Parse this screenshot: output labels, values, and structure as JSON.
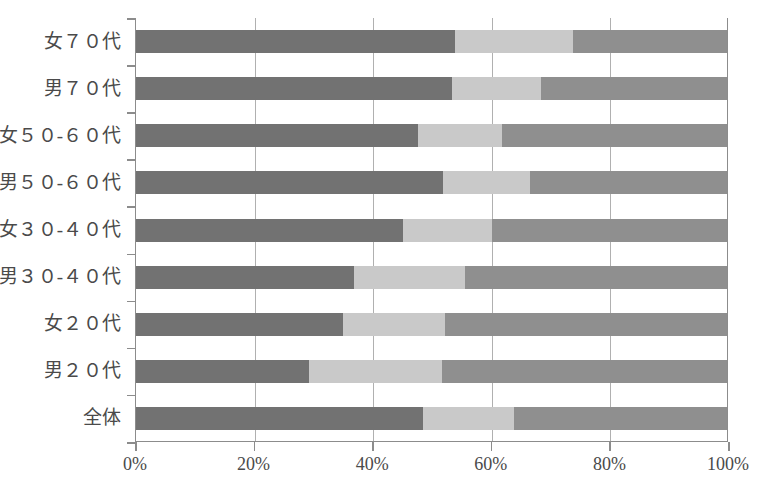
{
  "chart_data": {
    "type": "bar",
    "orientation": "horizontal",
    "stacked": true,
    "normalized": true,
    "title": "",
    "subtitle": "",
    "xlabel": "",
    "ylabel": "",
    "xlim": [
      0,
      100
    ],
    "grid": true,
    "legend": "none",
    "xticks": [
      0,
      20,
      40,
      60,
      80,
      100
    ],
    "xticklabels": [
      "0%",
      "20%",
      "40%",
      "60%",
      "80%",
      "100%"
    ],
    "categories": [
      "女７０代",
      "男７０代",
      "女５０-６０代",
      "男５０-６０代",
      "女３０-４０代",
      "男３０-４０代",
      "女２０代",
      "男２０代",
      "全体"
    ],
    "series": [
      {
        "name": "segment-1",
        "color": "#727272",
        "values": [
          54.0,
          53.5,
          47.7,
          52.0,
          45.2,
          36.8,
          35.1,
          29.2,
          48.6
        ]
      },
      {
        "name": "segment-2",
        "color": "#c9c9c9",
        "values": [
          20.0,
          15.1,
          14.3,
          14.6,
          15.0,
          18.8,
          17.2,
          22.6,
          15.4
        ]
      },
      {
        "name": "segment-3",
        "color": "#8f8f8f",
        "values": [
          26.0,
          31.4,
          38.0,
          33.4,
          39.8,
          44.4,
          47.7,
          48.2,
          36.0
        ]
      }
    ],
    "axis_color": "#8c8c8c",
    "grid_color": "#b0b0b0",
    "text_color": "#4a4a4a",
    "background": "#ffffff"
  }
}
